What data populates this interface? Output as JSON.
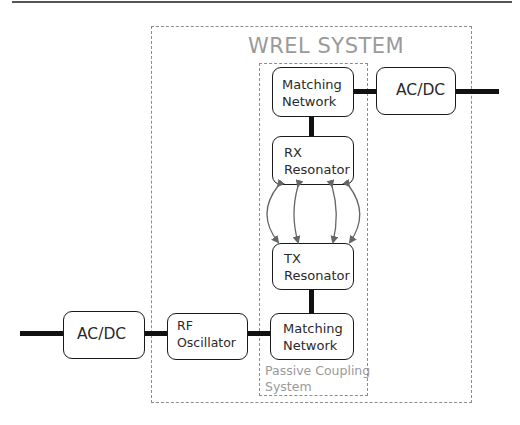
{
  "diagram": {
    "system_label": "WREL SYSTEM",
    "subsystem_label_line1": "Passive Coupling",
    "subsystem_label_line2": "System",
    "blocks": {
      "rx_matching": {
        "line1": "Matching",
        "line2": "Network"
      },
      "rx_acdc": {
        "line1": "AC/DC"
      },
      "rx_resonator": {
        "line1": "RX",
        "line2": "Resonator"
      },
      "tx_resonator": {
        "line1": "TX",
        "line2": "Resonator"
      },
      "tx_matching": {
        "line1": "Matching",
        "line2": "Network"
      },
      "rf_oscillator": {
        "line1": "RF",
        "line2": "Oscillator"
      },
      "tx_acdc": {
        "line1": "AC/DC"
      }
    },
    "connections": [
      "tx_acdc -> rf_oscillator",
      "rf_oscillator -> tx_matching",
      "tx_matching -> tx_resonator",
      "tx_resonator <-> rx_resonator (wireless coupling)",
      "rx_resonator -> rx_matching",
      "rx_matching -> rx_acdc"
    ],
    "colors": {
      "block_border": "#1a1a1a",
      "wire": "#111111",
      "dashed_border": "#8c8c8c",
      "label_gray": "#9a9a9a",
      "coupling_arrows": "#666666"
    }
  }
}
